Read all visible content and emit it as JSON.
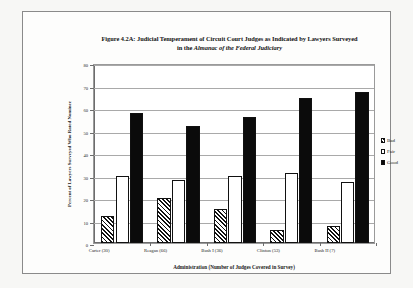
{
  "figure": {
    "title_line1": "Figure 4.2A: Judicial Temperament of Circuit Court Judges as Indicated by Lawyers Surveyed",
    "title_line2_prefix": "in the ",
    "title_line2_italic": "Almanac of the Federal Judiciary"
  },
  "chart_data": {
    "type": "bar",
    "title": "Figure 4.2A: Judicial Temperament of Circuit Court Judges as Indicated by Lawyers Surveyed in the Almanac of the Federal Judiciary",
    "xlabel": "Administration (Number of Judges Covered in Survey)",
    "ylabel": "Percent of Lawyers Surveyed Who Rated Nominee",
    "categories": [
      "Carter (30)",
      "Reagan (66)",
      "Bush I (36)",
      "Clinton (53)",
      "Bush II (7)"
    ],
    "series": [
      {
        "name": "Bad",
        "values": [
          12,
          20,
          15,
          6,
          7.5
        ]
      },
      {
        "name": "Fair",
        "values": [
          30,
          28,
          30,
          31,
          27
        ]
      },
      {
        "name": "Good",
        "values": [
          58,
          52,
          56,
          64.5,
          67
        ]
      }
    ],
    "ylim": [
      0,
      80
    ],
    "yticks": [
      0,
      10,
      20,
      30,
      40,
      50,
      60,
      70,
      80
    ],
    "ytick_labels": [
      "0",
      "10",
      "20",
      "30",
      "40",
      "50",
      "60",
      "70",
      "80"
    ],
    "grid": true,
    "legend_position": "right",
    "legend": [
      "Bad",
      "Fair",
      "Good"
    ],
    "colors": {
      "bad": "#ffffff",
      "bad_hatch": "#111111",
      "fair": "#ffffff",
      "good": "#0b0b0b",
      "outline": "#111111",
      "gridline": "#a9a9a9",
      "axis": "#6d6d6d"
    }
  }
}
